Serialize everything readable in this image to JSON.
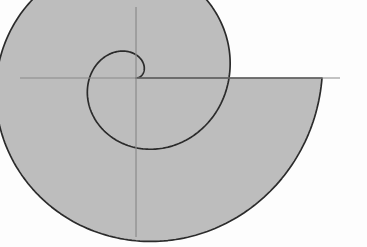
{
  "figure": {
    "background_color": "#fdfdfd",
    "width": 367,
    "height": 247
  },
  "colors": {
    "fill": "#bdbdbd",
    "curve_stroke": "#2b2b2b",
    "axis_stroke": "#8a8a8a"
  },
  "axes": {
    "origin": {
      "x": 136,
      "y": 78
    },
    "x_axis": {
      "x1": 20,
      "y1": 78,
      "x2": 340,
      "y2": 78,
      "width": 1.2
    },
    "y_axis": {
      "x1": 136,
      "y1": 7,
      "x2": 136,
      "y2": 237,
      "width": 1.2
    },
    "grid": "off",
    "tick_labels": [],
    "xlabel": "",
    "ylabel": ""
  },
  "chart_data": {
    "type": "line",
    "subtitle": "",
    "xlabel": "",
    "ylabel": "",
    "grid": false,
    "legend": [],
    "legend_position": "none",
    "polar": true,
    "equation": "r = a*theta",
    "scale_px_per_unit_r": 14.8,
    "theta_start_rad": 0,
    "theta_end_rad": 12.566,
    "turns": 2,
    "r_at_2pi_px": 93,
    "r_at_4pi_px": 186,
    "shaded_region": "between first turn (theta 0..2pi) and second turn (theta 2pi..4pi)",
    "annotations": [],
    "extremes_px": {
      "leftmost_x": 39,
      "rightmost_x": 322,
      "topmost_y": 24,
      "bottommost_y": 216
    },
    "series": [
      {
        "name": "spiral-outer-turn",
        "theta_deg": [
          360,
          405,
          450,
          495,
          540,
          585,
          630,
          675,
          720
        ],
        "r_px": [
          93,
          104.6,
          116.3,
          127.9,
          139.5,
          151.1,
          162.8,
          174.4,
          186
        ]
      },
      {
        "name": "spiral-inner-turn",
        "theta_deg": [
          0,
          45,
          90,
          135,
          180,
          225,
          270,
          315,
          360
        ],
        "r_px": [
          0,
          11.6,
          23.3,
          34.9,
          46.5,
          58.1,
          69.8,
          81.4,
          93
        ]
      },
      {
        "name": "radial-closing-segment",
        "theta_deg": [
          360,
          720
        ],
        "r_px": [
          93,
          186
        ]
      }
    ]
  },
  "paths": {
    "region_d": "M 136 78 L 139.0 76.7 L 142.6 74.2 L 145.5 70.8 L 147.4 66.6 L 148.1 62.0 L 147.5 57.2 L 145.6 52.3 L 142.4 47.6 L 138.0 43.2 L 132.5 39.3 L 126.0 36.1 L 118.8 33.5 L 111.0 31.7 L 102.8 30.7 L 94.5 30.6 L 86.2 31.4 L 78.1 33.0 L 70.4 35.5 L 63.3 38.7 L 56.9 42.7 L 51.3 47.4 L 46.6 52.7 L 42.9 58.5 L 40.2 64.7 L 38.6 71.2 L 38.1 78.0 L 38.7 84.9 L 40.4 91.9 L 43.2 98.8 L 47.0 105.6 L 51.7 112.2 L 57.3 118.5 L 63.8 124.5 L 71.0 130.0 L 78.8 135.1 L 87.2 139.6 L 96.1 143.5 L 105.4 146.7 L 115.0 149.3 L 124.9 151.1 L 134.9 152.2 L 145.0 152.5 L 155.1 152.1 L 165.1 150.9 L 175.0 148.9 L 184.6 146.2 L 194.0 142.7 L 203.0 138.5 L 211.6 133.6 L 219.7 128.1 L 227.3 121.9 L 234.3 115.2 L 240.7 107.9 L 246.4 100.1 L 251.4 91.9 L 255.6 83.2 L 259.0 74.2 L 261.6 64.9 L 263.3 55.3 L 264.2 45.5 L 264.2 35.6 L 263.3 25.7 L 261.5 15.8 L 258.9 6.0 L 255.4 -3.6 L 251.0 -12.9 L 245.8 -21.9 L 239.8 -30.6 L 233.0 -38.7 L 225.5 -46.3 L 217.2 -53.3 L 208.3 -59.6 L 198.8 -65.1 L 188.8 -69.8 L 178.3 -73.6 L 167.4 -76.5 L 156.2 -78.5 L 144.8 -79.4 L 133.2 -79.3 L 121.5 -78.2 L 109.9 -76.0 L 98.4 -72.8 L 87.1 -68.5 L 76.2 -63.2 L 65.7 -56.9 L 55.7 -49.7 L 46.4 -41.5 L 37.8 -32.5 L 30.0 -22.7 L 23.1 -12.2 L 17.2 -1.0 Z",
    "note": "region path is generated procedurally by the template script from chart_data"
  }
}
